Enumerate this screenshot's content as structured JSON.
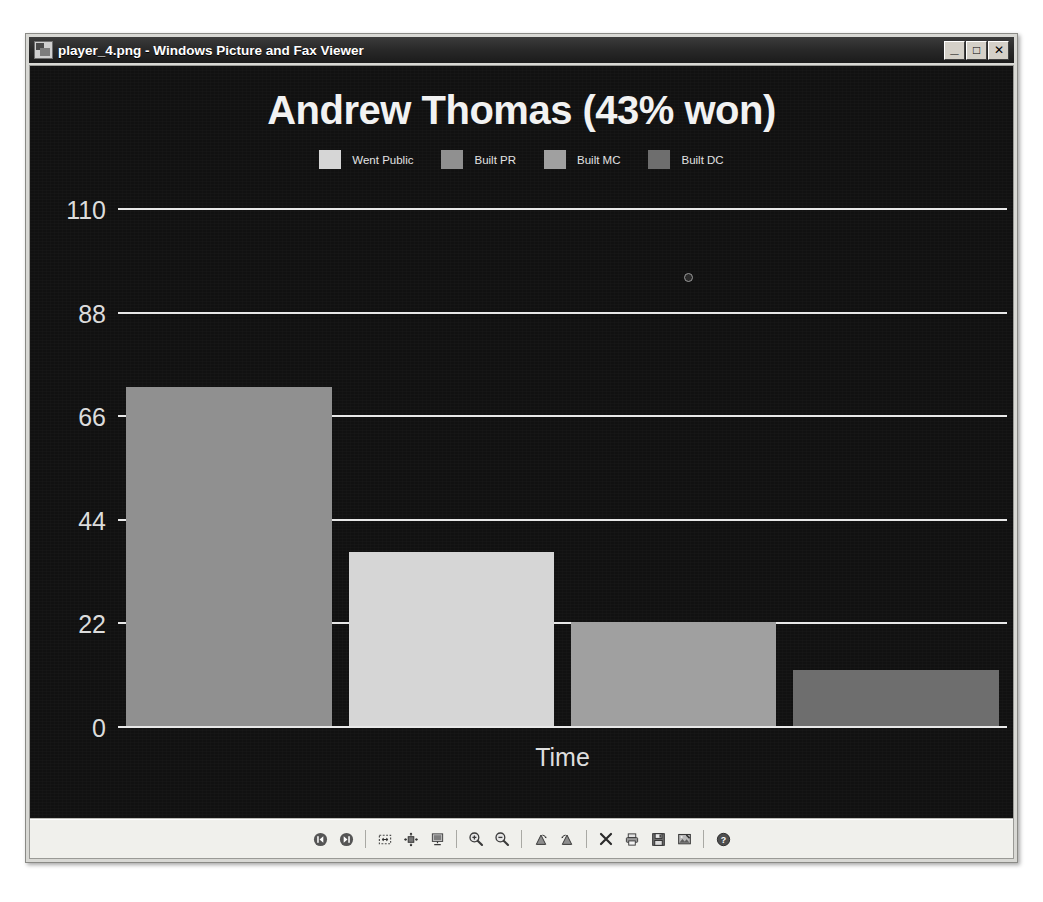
{
  "window": {
    "title": "player_4.png - Windows Picture and Fax Viewer",
    "app_icon": "picture-file-icon",
    "controls": [
      {
        "name": "minimize",
        "glyph": "_"
      },
      {
        "name": "maximize",
        "glyph": "□"
      },
      {
        "name": "close",
        "glyph": "✕"
      }
    ]
  },
  "chart_data": {
    "type": "bar",
    "title": "Andrew Thomas (43% won)",
    "xlabel": "Time",
    "ylabel": "",
    "categories": [
      "Went Public",
      "Built PR",
      "Built MC",
      "Built DC"
    ],
    "values": [
      72,
      37,
      22,
      12
    ],
    "ylim": [
      0,
      110
    ],
    "yticks": [
      0,
      22,
      44,
      66,
      88,
      110
    ],
    "grid": true,
    "legend_position": "top",
    "background_color": "#111111",
    "text_color": "#e8e8e8",
    "gridline_color": "#e8e8e8",
    "series_colors": [
      "#d6d6d6",
      "#909090",
      "#a0a0a0",
      "#6e6e6e"
    ],
    "bar_colors": [
      "#909090",
      "#d6d6d6",
      "#a0a0a0",
      "#6e6e6e"
    ]
  },
  "toolbar": {
    "buttons": [
      {
        "name": "previous-image-button",
        "icon": "previous-icon"
      },
      {
        "name": "next-image-button",
        "icon": "next-icon"
      },
      {
        "name": "best-fit-button",
        "icon": "best-fit-icon"
      },
      {
        "name": "actual-size-button",
        "icon": "actual-size-icon"
      },
      {
        "name": "slideshow-button",
        "icon": "slideshow-icon"
      },
      {
        "name": "zoom-in-button",
        "icon": "zoom-in-icon"
      },
      {
        "name": "zoom-out-button",
        "icon": "zoom-out-icon"
      },
      {
        "name": "rotate-clockwise-button",
        "icon": "rotate-cw-icon"
      },
      {
        "name": "rotate-counterclockwise-button",
        "icon": "rotate-ccw-icon"
      },
      {
        "name": "delete-button",
        "icon": "delete-icon"
      },
      {
        "name": "print-button",
        "icon": "print-icon"
      },
      {
        "name": "copy-to-button",
        "icon": "save-icon"
      },
      {
        "name": "edit-image-button",
        "icon": "edit-icon"
      },
      {
        "name": "help-button",
        "icon": "help-icon"
      }
    ]
  }
}
